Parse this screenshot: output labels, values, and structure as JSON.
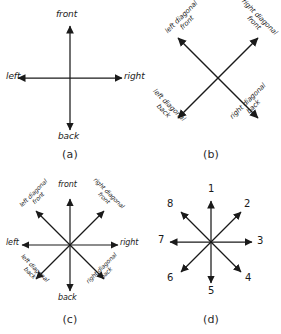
{
  "figure": {
    "background_color": "#ffffff",
    "ink_color": "#1a1a1a"
  },
  "panels": [
    {
      "id": "a",
      "caption": "(a)",
      "description": "Four cardinal body directions",
      "arrows": [
        {
          "name": "front",
          "label": "front",
          "angle_deg": 90
        },
        {
          "name": "right",
          "label": "right",
          "angle_deg": 0
        },
        {
          "name": "back",
          "label": "back",
          "angle_deg": 270
        },
        {
          "name": "left",
          "label": "left",
          "angle_deg": 180
        }
      ]
    },
    {
      "id": "b",
      "caption": "(b)",
      "description": "Four diagonal body directions",
      "arrows": [
        {
          "name": "left-diagonal-front",
          "line1": "left diagonal",
          "line2": "front",
          "angle_deg": 135
        },
        {
          "name": "right-diagonal-front",
          "line1": "right diagonal",
          "line2": "front",
          "angle_deg": 45
        },
        {
          "name": "left-diagonal-back",
          "line1": "left diagonal",
          "line2": "back",
          "angle_deg": 225
        },
        {
          "name": "right-diagonal-back",
          "line1": "right diagonal",
          "line2": "back",
          "angle_deg": 315
        }
      ]
    },
    {
      "id": "c",
      "caption": "(c)",
      "description": "All eight body directions combined",
      "arrows": [
        {
          "name": "front",
          "label": "front",
          "angle_deg": 90
        },
        {
          "name": "right",
          "label": "right",
          "angle_deg": 0
        },
        {
          "name": "back",
          "label": "back",
          "angle_deg": 270
        },
        {
          "name": "left",
          "label": "left",
          "angle_deg": 180
        },
        {
          "name": "left-diagonal-front",
          "line1": "left diagonal",
          "line2": "front",
          "angle_deg": 135
        },
        {
          "name": "right-diagonal-front",
          "line1": "right diagonal",
          "line2": "front",
          "angle_deg": 45
        },
        {
          "name": "left-diagonal-back",
          "line1": "left diagonal",
          "line2": "back",
          "angle_deg": 225
        },
        {
          "name": "right-diagonal-back",
          "line1": "right diagonal",
          "line2": "back",
          "angle_deg": 315
        }
      ]
    },
    {
      "id": "d",
      "caption": "(d)",
      "description": "Eight directions numbered clockwise from top",
      "arrows": [
        {
          "name": "direction-1",
          "label": "1",
          "angle_deg": 90
        },
        {
          "name": "direction-2",
          "label": "2",
          "angle_deg": 45
        },
        {
          "name": "direction-3",
          "label": "3",
          "angle_deg": 0
        },
        {
          "name": "direction-4",
          "label": "4",
          "angle_deg": 315
        },
        {
          "name": "direction-5",
          "label": "5",
          "angle_deg": 270
        },
        {
          "name": "direction-6",
          "label": "6",
          "angle_deg": 225
        },
        {
          "name": "direction-7",
          "label": "7",
          "angle_deg": 180
        },
        {
          "name": "direction-8",
          "label": "8",
          "angle_deg": 135
        }
      ]
    }
  ]
}
